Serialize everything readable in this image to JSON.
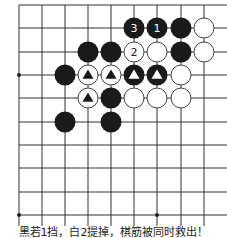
{
  "diagram": {
    "type": "go-board-fragment",
    "grid": {
      "x_lines": [
        19,
        42,
        65,
        88,
        111,
        134,
        157,
        181,
        204
      ],
      "y_lines": [
        5,
        28,
        52,
        75,
        98,
        122,
        145,
        168,
        192,
        215
      ],
      "right_edge_open": true,
      "line_color": "#333333",
      "star_points": [
        [
          0,
          3
        ],
        [
          0,
          9
        ],
        [
          6,
          9
        ]
      ]
    },
    "stone_radius": 10.5,
    "colors": {
      "black": "#1a1a1a",
      "white": "#ffffff",
      "white_stroke": "#444444"
    },
    "stones": [
      {
        "col": 5,
        "row": 1,
        "color": "black",
        "label": "3"
      },
      {
        "col": 6,
        "row": 1,
        "color": "black",
        "label": "1"
      },
      {
        "col": 7,
        "row": 1,
        "color": "black",
        "label": ""
      },
      {
        "col": 8,
        "row": 1,
        "color": "white",
        "label": ""
      },
      {
        "col": 3,
        "row": 2,
        "color": "black",
        "label": ""
      },
      {
        "col": 4,
        "row": 2,
        "color": "black",
        "label": ""
      },
      {
        "col": 5,
        "row": 2,
        "color": "white",
        "label": "2"
      },
      {
        "col": 6,
        "row": 2,
        "color": "white",
        "label": ""
      },
      {
        "col": 7,
        "row": 2,
        "color": "black",
        "label": ""
      },
      {
        "col": 8,
        "row": 2,
        "color": "white",
        "label": ""
      },
      {
        "col": 2,
        "row": 3,
        "color": "black",
        "label": ""
      },
      {
        "col": 3,
        "row": 3,
        "color": "white",
        "label": "",
        "mark": "triangle"
      },
      {
        "col": 4,
        "row": 3,
        "color": "white",
        "label": "",
        "mark": "triangle"
      },
      {
        "col": 5,
        "row": 3,
        "color": "black",
        "label": "",
        "mark": "triangle"
      },
      {
        "col": 6,
        "row": 3,
        "color": "black",
        "label": "",
        "mark": "triangle"
      },
      {
        "col": 7,
        "row": 3,
        "color": "white",
        "label": ""
      },
      {
        "col": 3,
        "row": 4,
        "color": "white",
        "label": "",
        "mark": "triangle"
      },
      {
        "col": 4,
        "row": 4,
        "color": "black",
        "label": ""
      },
      {
        "col": 5,
        "row": 4,
        "color": "white",
        "label": ""
      },
      {
        "col": 6,
        "row": 4,
        "color": "white",
        "label": ""
      },
      {
        "col": 7,
        "row": 4,
        "color": "white",
        "label": ""
      },
      {
        "col": 2,
        "row": 5,
        "color": "black",
        "label": ""
      },
      {
        "col": 4,
        "row": 5,
        "color": "black",
        "label": ""
      }
    ]
  },
  "caption": "黑若1挡，白2提掉，棋筋被同时救出！"
}
